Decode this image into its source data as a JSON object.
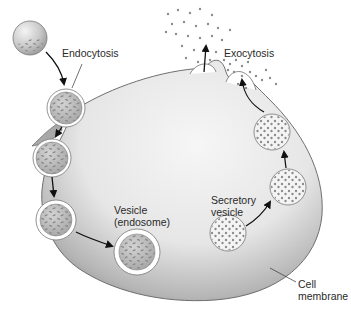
{
  "diagram": {
    "labels": {
      "endocytosis": "Endocytosis",
      "exocytosis": "Exocytosis",
      "vesicle_line1": "Vesicle",
      "vesicle_line2": "(endosome)",
      "secretory_line1": "Secretory",
      "secretory_line2": "vesicle",
      "membrane_line1": "Cell",
      "membrane_line2": "membrane"
    },
    "colors": {
      "cell_light": "#f2f2f2",
      "cell_dark": "#8a8a8a",
      "cell_outline": "#6f6f6f",
      "vesicle_fill": "#b9b9b9",
      "vesicle_ring": "#ffffff",
      "particle": "#8c8c8c",
      "arrow": "#111111",
      "text": "#2a2a2a"
    },
    "endocytosis_vesicles": [
      {
        "name": "extracellular-particle",
        "cx": 30,
        "cy": 38,
        "r": 17
      },
      {
        "name": "budding-vesicle",
        "cx": 66,
        "cy": 108,
        "r": 18
      },
      {
        "name": "internalizing-vesicle",
        "cx": 52,
        "cy": 158,
        "r": 18
      },
      {
        "name": "internal-vesicle",
        "cx": 56,
        "cy": 220,
        "r": 19
      },
      {
        "name": "endosome",
        "cx": 137,
        "cy": 252,
        "r": 22
      }
    ],
    "secretory_vesicles": [
      {
        "name": "secretory-vesicle",
        "cx": 228,
        "cy": 233,
        "r": 18
      },
      {
        "name": "transport-vesicle-lower",
        "cx": 288,
        "cy": 187,
        "r": 18
      },
      {
        "name": "transport-vesicle-upper",
        "cx": 272,
        "cy": 132,
        "r": 18
      }
    ]
  }
}
